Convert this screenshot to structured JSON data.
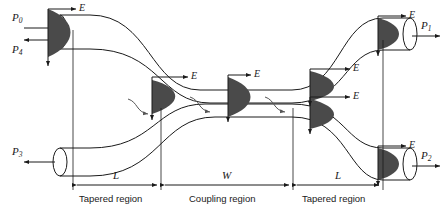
{
  "figure": {
    "type": "optical-directional-coupler-schematic",
    "stroke_color": "#1a1a1a",
    "cone_fill": "#4a4a4a",
    "background": "#ffffff"
  },
  "ports": [
    {
      "id": "p0",
      "label": "P",
      "sub": "0",
      "x": 14,
      "y": 18,
      "direction": "input-right"
    },
    {
      "id": "p4",
      "label": "P",
      "sub": "4",
      "x": 14,
      "y": 45,
      "direction": "output-left"
    },
    {
      "id": "p3",
      "label": "P",
      "sub": "3",
      "x": 14,
      "y": 148,
      "direction": "output-left"
    },
    {
      "id": "p1",
      "label": "P",
      "sub": "1",
      "x": 423,
      "y": 22,
      "direction": "output-right"
    },
    {
      "id": "p2",
      "label": "P",
      "sub": "2",
      "x": 423,
      "y": 152,
      "direction": "output-right"
    }
  ],
  "field_labels": [
    {
      "id": "e-in",
      "text": "E",
      "x": 78,
      "y": 8
    },
    {
      "id": "e-mid-left",
      "text": "E",
      "x": 190,
      "y": 76
    },
    {
      "id": "e-mid",
      "text": "E",
      "x": 253,
      "y": 76
    },
    {
      "id": "e-out-top",
      "text": "E",
      "x": 352,
      "y": 76
    },
    {
      "id": "e-out-bot",
      "text": "E",
      "x": 352,
      "y": 103
    },
    {
      "id": "e-p1",
      "text": "E",
      "x": 408,
      "y": 14
    },
    {
      "id": "e-p2",
      "text": "E",
      "x": 408,
      "y": 144
    }
  ],
  "dimensions": [
    {
      "id": "left-taper",
      "symbol": "L",
      "symbol_x": 116,
      "symbol_y": 176,
      "region": "Tapered region",
      "region_x": 82,
      "region_y": 196,
      "start_x": 73,
      "end_x": 160
    },
    {
      "id": "coupling",
      "symbol": "W",
      "symbol_x": 225,
      "symbol_y": 176,
      "region": "Coupling region",
      "region_x": 192,
      "region_y": 196,
      "start_x": 162,
      "end_x": 292
    },
    {
      "id": "right-taper",
      "symbol": "L",
      "symbol_x": 338,
      "symbol_y": 176,
      "region": "Tapered region",
      "region_x": 305,
      "region_y": 196,
      "start_x": 294,
      "end_x": 383
    }
  ],
  "mode_profiles": [
    {
      "id": "cone-p0",
      "x": 48,
      "y": 10,
      "w": 38,
      "h": 48
    },
    {
      "id": "cone-mid-l",
      "x": 152,
      "y": 80,
      "w": 35,
      "h": 34
    },
    {
      "id": "cone-mid-c",
      "x": 228,
      "y": 78,
      "w": 32,
      "h": 38
    },
    {
      "id": "cone-out-t",
      "x": 310,
      "y": 72,
      "w": 35,
      "h": 30
    },
    {
      "id": "cone-out-b",
      "x": 310,
      "y": 100,
      "w": 35,
      "h": 30
    },
    {
      "id": "cone-p1",
      "x": 378,
      "y": 18,
      "w": 30,
      "h": 32
    },
    {
      "id": "cone-p2",
      "x": 378,
      "y": 148,
      "w": 30,
      "h": 32
    }
  ],
  "coupling_arrows": [
    {
      "id": "transfer-1",
      "from": "upper",
      "to": "lower"
    },
    {
      "id": "transfer-2",
      "from": "upper",
      "to": "lower"
    },
    {
      "id": "transfer-3",
      "from": "upper",
      "to": "lower"
    }
  ]
}
